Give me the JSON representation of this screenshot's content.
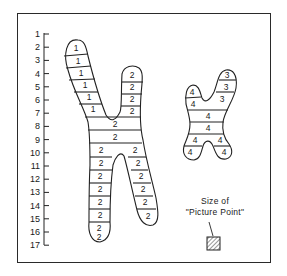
{
  "scale": {
    "ticks": [
      "1",
      "2",
      "3",
      "4",
      "5",
      "6",
      "7",
      "8",
      "9",
      "10",
      "11",
      "12",
      "13",
      "14",
      "15",
      "16",
      "17"
    ]
  },
  "chromosome_a": {
    "upper_left_arm": [
      "1",
      "1",
      "1",
      "1",
      "1",
      "1"
    ],
    "upper_right_arm": [
      "2",
      "2",
      "2",
      "2"
    ],
    "center": [
      "2",
      "2"
    ],
    "lower_left_arm": [
      "2",
      "2",
      "2",
      "2",
      "2",
      "2",
      "2",
      "2"
    ],
    "lower_right_arm": [
      "2",
      "2",
      "2",
      "2",
      "2",
      "2"
    ]
  },
  "chromosome_b": {
    "upper_left_arm": [
      "4",
      "4"
    ],
    "upper_right_arm": [
      "3",
      "3",
      "3"
    ],
    "center": [
      "4",
      "4"
    ],
    "lower_left_arm": [
      "4",
      "4"
    ],
    "lower_right_arm": [
      "4",
      "4"
    ]
  },
  "legend": {
    "line1": "Size of",
    "line2": "\"Picture Point\"",
    "swatch": "hatched-square"
  }
}
